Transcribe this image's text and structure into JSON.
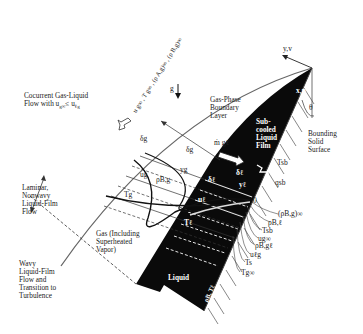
{
  "diagram": {
    "title_labels": {
      "flow_description": "Cocurrent Gas-Liquid\nFlow with u",
      "flow_description_sub": "g∞",
      "flow_description_tail": "≤ u",
      "flow_description_sub2": "ℓg",
      "freestream": "u g∞ , T g∞ , (ρ A,g)∞ , (ρ B,g)∞",
      "gravity": "g",
      "gas_boundary_layer": "Gas-Phase\nBoundary\nLayer",
      "liquid_film": "Sub-\ncooled\nLiquid\nFilm",
      "bounding_surface": "Bounding\nSolid\nSurface",
      "laminar_region": "Laminar,\nNonwavy\nLiquid-Film\nFlow",
      "wavy_region": "Wavy\nLiquid-Film\nFlow and\nTransition to\nTurbulence",
      "gas_region": "Gas (Including\nSuperheated\nVapor)",
      "liquid_region": "Liquid",
      "liquid_props": "ρB, Tℓ"
    },
    "axes": {
      "y_axis": "y,v",
      "x_axis": "x,u",
      "angle": "θ"
    },
    "symbols": {
      "delta_g_top": "δg",
      "delta_g_mid": "δg",
      "m_dot": "ṁ gℓ",
      "delta_l_right": "δℓ",
      "delta_l_left": "δℓ",
      "y_g": "yg",
      "y_l": "yℓ",
      "u_g": "ug",
      "rho_Bg": "ρB,g",
      "T_g": "Tg",
      "u_l": "uℓ",
      "T_l": "Tℓ",
      "T_sb": "Tsb",
      "q_sb": "qsb",
      "zero": "0"
    },
    "profile_legend": [
      "(ρB,g)∞",
      "ρB,ℓ",
      "Tsb",
      "ug∞",
      "ρB,gℓ",
      "uℓg",
      "Ts",
      "Tg∞"
    ],
    "colors": {
      "liquid_fill": "#0a0a0a",
      "line": "#333333",
      "background": "#ffffff"
    }
  }
}
